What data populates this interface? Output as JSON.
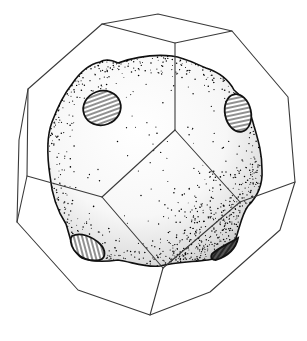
{
  "figure": {
    "title": "Stippled void inside a truncated-octahedron cell",
    "shading_style": "stipple",
    "colors": {
      "background": "#ffffff",
      "edge": "#3a3a3a",
      "outline": "#111111",
      "stipple": "#000000",
      "hatch": "#222222"
    },
    "polyhedron": {
      "name": "truncated octahedron"
    },
    "cavity": {
      "name": "rounded cavity",
      "shading": "stippled, darker toward lower right"
    },
    "contact_patches": [
      {
        "name": "upper-left patch",
        "hatch": "horizontal"
      },
      {
        "name": "upper-right patch",
        "hatch": "horizontal"
      },
      {
        "name": "lower-left patch",
        "hatch": "vertical"
      },
      {
        "name": "lower-right patch",
        "hatch": "diagonal"
      }
    ]
  }
}
